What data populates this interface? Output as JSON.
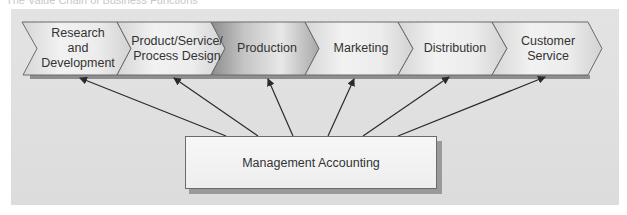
{
  "caption": "The Value Chain of Business Functions",
  "value_chain": {
    "functions": [
      {
        "id": "rd",
        "label": "Research\nand\nDevelopment",
        "lines": [
          "Research",
          "and",
          "Development"
        ],
        "highlighted": false
      },
      {
        "id": "design",
        "label": "Product/Service/\nProcess Design",
        "lines": [
          "Product/Service/",
          "Process Design"
        ],
        "highlighted": false
      },
      {
        "id": "production",
        "label": "Production",
        "lines": [
          "Production"
        ],
        "highlighted": true
      },
      {
        "id": "marketing",
        "label": "Marketing",
        "lines": [
          "Marketing"
        ],
        "highlighted": false
      },
      {
        "id": "distribution",
        "label": "Distribution",
        "lines": [
          "Distribution"
        ],
        "highlighted": false
      },
      {
        "id": "service",
        "label": "Customer\nService",
        "lines": [
          "Customer",
          "Service"
        ],
        "highlighted": false
      }
    ]
  },
  "support_box": {
    "label": "Management Accounting",
    "arrows_to": [
      "rd",
      "design",
      "production",
      "marketing",
      "distribution",
      "service"
    ]
  },
  "colors": {
    "panel": "#e0e0e0",
    "chevron_light": "#f0f0f0",
    "chevron_dark": "#9c9c9c",
    "outline": "#6b6b6b",
    "arrow": "#2a2a2a",
    "text": "#333333"
  }
}
